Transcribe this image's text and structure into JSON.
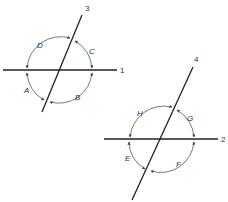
{
  "diagram": {
    "colors": {
      "line": "#222222",
      "arc": "#555555",
      "text": "#333333"
    },
    "figures": [
      {
        "id": "figure-1",
        "lines": [
          {
            "label": "1",
            "x1": 3,
            "y1": 70,
            "x2": 117,
            "y2": 70,
            "label_x": 120,
            "label_y": 73
          },
          {
            "label": "3",
            "x1": 82,
            "y1": 15,
            "x2": 42,
            "y2": 112,
            "label_x": 85,
            "label_y": 11
          }
        ],
        "angles": [
          {
            "label": "C",
            "label_x": 89,
            "label_y": 54,
            "from": [
              75,
              41
            ],
            "to": [
              92,
              68
            ]
          },
          {
            "label": "D",
            "label_x": 37,
            "label_y": 48,
            "from": [
              70,
              38
            ],
            "to": [
              27,
              68
            ]
          },
          {
            "label": "A",
            "label_x": 24,
            "label_y": 93,
            "from": [
              27,
              73
            ],
            "to": [
              44,
              100
            ]
          },
          {
            "label": "B",
            "label_x": 75,
            "label_y": 100,
            "from": [
              50,
              102
            ],
            "to": [
              92,
              73
            ]
          }
        ]
      },
      {
        "id": "figure-2",
        "lines": [
          {
            "label": "2",
            "x1": 104,
            "y1": 139,
            "x2": 218,
            "y2": 139,
            "label_x": 221,
            "label_y": 142
          },
          {
            "label": "4",
            "x1": 193,
            "y1": 67,
            "x2": 132,
            "y2": 200,
            "label_x": 194,
            "label_y": 62
          }
        ],
        "angles": [
          {
            "label": "G",
            "label_x": 187,
            "label_y": 121,
            "from": [
              177,
              110
            ],
            "to": [
              194,
              137
            ]
          },
          {
            "label": "H",
            "label_x": 137,
            "label_y": 116,
            "from": [
              172,
              107
            ],
            "to": [
              130,
              137
            ]
          },
          {
            "label": "E",
            "label_x": 125,
            "label_y": 161,
            "from": [
              129,
              142
            ],
            "to": [
              145,
              169
            ]
          },
          {
            "label": "F",
            "label_x": 176,
            "label_y": 167,
            "from": [
              151,
              171
            ],
            "to": [
              194,
              142
            ]
          }
        ]
      }
    ]
  }
}
